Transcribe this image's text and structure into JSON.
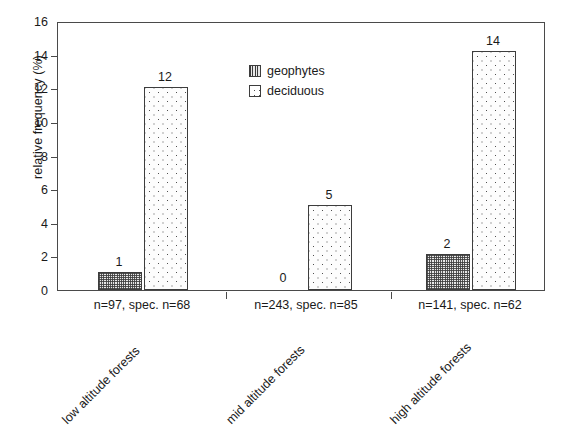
{
  "chart_data": {
    "type": "bar",
    "title": "",
    "subtitle": "",
    "xlabel": "",
    "ylabel": "relative frequency (%)",
    "ylim": [
      0,
      16
    ],
    "ytick_step": 2,
    "yticks": [
      "0",
      "2",
      "4",
      "6",
      "8",
      "10",
      "12",
      "14",
      "16"
    ],
    "grid": false,
    "legend_position": "inside-top-center",
    "categories": [
      "low altitude forests",
      "mid altitude forests",
      "high altitude forests"
    ],
    "group_sublabels": [
      "n=97, spec. n=68",
      "n=243, spec. n=85",
      "n=141, spec. n=62"
    ],
    "series": [
      {
        "name": "geophytes",
        "pattern": "crosshatch",
        "values": [
          1.05,
          0,
          2.15
        ],
        "data_labels": [
          "1",
          "0",
          "2"
        ]
      },
      {
        "name": "deciduous",
        "pattern": "dots",
        "values": [
          12.05,
          5.05,
          14.2
        ],
        "data_labels": [
          "12",
          "5",
          "14"
        ]
      }
    ],
    "colors": {
      "axis": "#4a4a4a",
      "bar_outline": "#3d3d3d",
      "text": "#1a1a1a",
      "background": "#ffffff"
    }
  },
  "legend": {
    "items": [
      {
        "label": "geophytes",
        "swatch": "crosshatch-swatch"
      },
      {
        "label": "deciduous",
        "swatch": "dotted-swatch"
      }
    ]
  }
}
